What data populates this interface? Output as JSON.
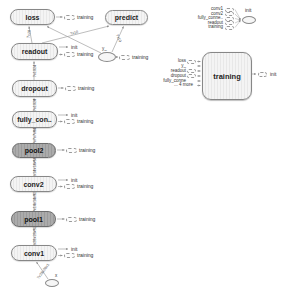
{
  "nodes": {
    "loss": "loss",
    "predict": "predict",
    "readout": "readout",
    "dropout": "dropout",
    "fully_connected": "fully_con..",
    "pool2": "pool2",
    "conv2": "conv2",
    "pool1": "pool1",
    "conv1": "conv1",
    "x_input": "x",
    "y_input": "y_"
  },
  "stubs": {
    "init": "init",
    "training": "training"
  },
  "edge_labels": {
    "x_to_conv1": "?x28x28x1",
    "conv1_to_pool1": "?x28x28x32",
    "pool1_to_conv2": "?x14x14x32",
    "conv2_to_pool2": "?x14x14x64",
    "pool2_to_fully": "?x7x7x64",
    "fully_to_dropout": "?x1024",
    "dropout_to_readout": "?x1024",
    "readout_to_loss": "?x10",
    "readout_to_predict": "?x10",
    "y_to_predict": "?x10"
  },
  "init_group": {
    "inputs": [
      "conv1",
      "conv2",
      "fully_conne..",
      "readout",
      "training"
    ],
    "target": "init"
  },
  "training_group": {
    "label": "training",
    "inputs": [
      "loss",
      "y_",
      "readout",
      "dropout",
      "fully_conne"
    ],
    "more": "... 4 more",
    "output": "init"
  },
  "colors": {
    "node_fill": "#f4f4f4",
    "pool_fill": "#a3a3a3",
    "edge": "#a0a0a0",
    "node_border": "#878787",
    "background": "#ffffff"
  }
}
